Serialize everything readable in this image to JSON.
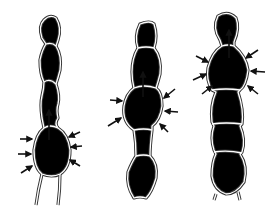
{
  "figure": {
    "panels": [
      {
        "id": "stage-1",
        "compressed_segment": "lower bulb",
        "inward_arrows": 6,
        "flow_arrow": "up"
      },
      {
        "id": "stage-2",
        "compressed_segment": "middle bulb",
        "inward_arrows": 6,
        "flow_arrow": "up"
      },
      {
        "id": "stage-3",
        "compressed_segment": "upper bulb",
        "inward_arrows": 6,
        "flow_arrow": "up"
      }
    ],
    "colors": {
      "line": "#333333",
      "arrow": "#111111",
      "background": "#ffffff"
    }
  }
}
